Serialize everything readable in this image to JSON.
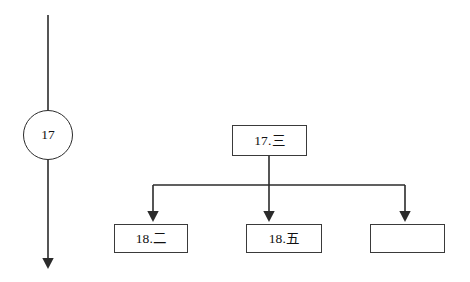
{
  "diagram": {
    "type": "flowchart-tree",
    "background_color": "#ffffff",
    "line_color": "#2b2b2b",
    "box_border_color": "#3a3a3a",
    "text_color": "#111111",
    "circle_node": {
      "label": "17",
      "shape": "circle"
    },
    "parent_node": {
      "label": "17.三",
      "shape": "rectangle"
    },
    "child_nodes": [
      {
        "label": "18.二",
        "shape": "rectangle"
      },
      {
        "label": "18.五",
        "shape": "rectangle"
      },
      {
        "label": "",
        "shape": "rectangle"
      }
    ]
  }
}
